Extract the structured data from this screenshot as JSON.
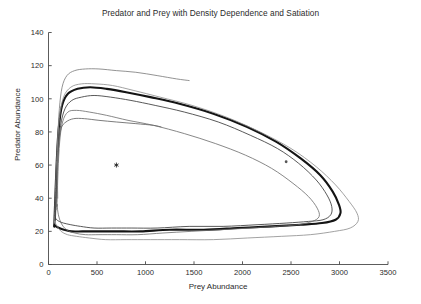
{
  "figure": {
    "background_color": "#ffffff",
    "axis_color": "#4a4a4a",
    "text_color": "#2b2b2b"
  },
  "chart_data": {
    "type": "line",
    "title": "Predator and Prey with Density Dependence and Satiation",
    "xlabel": "Prey Abundance",
    "ylabel": "Predator Abundance",
    "xlim": [
      0,
      3500
    ],
    "ylim": [
      0,
      140
    ],
    "xticks": [
      0,
      500,
      1000,
      1500,
      2000,
      2500,
      3000,
      3500
    ],
    "xticklabels": [
      "0",
      "500",
      "1000",
      "1500",
      "2000",
      "2500",
      "3000",
      "3500"
    ],
    "yticks": [
      0,
      20,
      40,
      60,
      80,
      100,
      120,
      140
    ],
    "yticklabels": [
      "0",
      "20",
      "40",
      "60",
      "80",
      "100",
      "120",
      "140"
    ],
    "grid": false,
    "legend": null,
    "axis_style": "left-and-bottom-spines-only",
    "markers": [
      {
        "name": "equilibrium-point",
        "symbol": "asterisk",
        "x": 700,
        "y": 60,
        "color": "#1a1a1a",
        "size": 5
      },
      {
        "name": "initial-condition-dot",
        "symbol": "dot",
        "x": 2450,
        "y": 62,
        "color": "#555555",
        "size": 1.4
      }
    ],
    "series": [
      {
        "name": "limit-cycle",
        "role": "stable limit cycle (attractor)",
        "color": "#141414",
        "linewidth": 2.1,
        "closed": true,
        "points": [
          [
            60,
            24
          ],
          [
            70,
            40
          ],
          [
            85,
            62
          ],
          [
            105,
            82
          ],
          [
            140,
            96
          ],
          [
            200,
            103
          ],
          [
            300,
            106
          ],
          [
            430,
            107
          ],
          [
            600,
            106
          ],
          [
            800,
            104
          ],
          [
            1050,
            101
          ],
          [
            1350,
            97
          ],
          [
            1700,
            91
          ],
          [
            2050,
            83
          ],
          [
            2350,
            74
          ],
          [
            2600,
            64
          ],
          [
            2800,
            54
          ],
          [
            2930,
            44
          ],
          [
            2995,
            36
          ],
          [
            3010,
            31
          ],
          [
            2960,
            27
          ],
          [
            2820,
            25
          ],
          [
            2600,
            24
          ],
          [
            2300,
            23
          ],
          [
            1950,
            22
          ],
          [
            1600,
            21
          ],
          [
            1250,
            21
          ],
          [
            950,
            20
          ],
          [
            700,
            20
          ],
          [
            500,
            20
          ],
          [
            350,
            20
          ],
          [
            240,
            20
          ],
          [
            160,
            21
          ],
          [
            110,
            22
          ],
          [
            78,
            23
          ],
          [
            60,
            24
          ]
        ]
      },
      {
        "name": "trajectory-inner-1",
        "role": "trajectory converging from inside",
        "color": "#3b3b3b",
        "linewidth": 0.85,
        "closed": true,
        "points": [
          [
            72,
            28
          ],
          [
            84,
            48
          ],
          [
            100,
            68
          ],
          [
            125,
            84
          ],
          [
            170,
            94
          ],
          [
            240,
            99
          ],
          [
            340,
            101
          ],
          [
            470,
            102
          ],
          [
            640,
            101
          ],
          [
            850,
            99
          ],
          [
            1100,
            96
          ],
          [
            1400,
            92
          ],
          [
            1750,
            86
          ],
          [
            2080,
            78
          ],
          [
            2360,
            70
          ],
          [
            2580,
            61
          ],
          [
            2760,
            51
          ],
          [
            2870,
            42
          ],
          [
            2920,
            35
          ],
          [
            2910,
            30
          ],
          [
            2830,
            27
          ],
          [
            2680,
            26
          ],
          [
            2450,
            25
          ],
          [
            2150,
            24
          ],
          [
            1800,
            23
          ],
          [
            1450,
            23
          ],
          [
            1120,
            22
          ],
          [
            860,
            22
          ],
          [
            650,
            22
          ],
          [
            470,
            22
          ],
          [
            330,
            23
          ],
          [
            230,
            24
          ],
          [
            155,
            25
          ],
          [
            110,
            26
          ],
          [
            85,
            27
          ],
          [
            72,
            28
          ]
        ]
      },
      {
        "name": "trajectory-inner-2",
        "role": "inner trajectory (open arc)",
        "color": "#5a5a5a",
        "linewidth": 0.8,
        "closed": false,
        "points": [
          [
            78,
            33
          ],
          [
            88,
            53
          ],
          [
            104,
            71
          ],
          [
            130,
            82
          ],
          [
            180,
            86
          ],
          [
            260,
            88
          ],
          [
            370,
            88
          ],
          [
            520,
            87
          ],
          [
            700,
            86
          ],
          [
            900,
            85
          ],
          [
            1080,
            84
          ],
          [
            1160,
            83
          ]
        ]
      },
      {
        "name": "trajectory-middle",
        "role": "intermediate trajectory",
        "color": "#6a6a6a",
        "linewidth": 0.8,
        "closed": true,
        "points": [
          [
            88,
            36
          ],
          [
            98,
            56
          ],
          [
            115,
            74
          ],
          [
            145,
            86
          ],
          [
            200,
            92
          ],
          [
            290,
            93
          ],
          [
            420,
            92
          ],
          [
            600,
            90
          ],
          [
            820,
            87
          ],
          [
            1080,
            84
          ],
          [
            1400,
            79
          ],
          [
            1720,
            73
          ],
          [
            2030,
            66
          ],
          [
            2300,
            58
          ],
          [
            2520,
            49
          ],
          [
            2680,
            41
          ],
          [
            2770,
            34
          ],
          [
            2790,
            29
          ],
          [
            2720,
            26
          ],
          [
            2570,
            24
          ],
          [
            2350,
            23
          ],
          [
            2080,
            22
          ],
          [
            1780,
            21
          ],
          [
            1470,
            20
          ],
          [
            1180,
            19
          ],
          [
            920,
            18
          ],
          [
            700,
            18
          ],
          [
            520,
            18
          ],
          [
            380,
            18
          ],
          [
            270,
            19
          ],
          [
            185,
            21
          ],
          [
            130,
            25
          ],
          [
            102,
            30
          ],
          [
            88,
            36
          ]
        ]
      },
      {
        "name": "trajectory-outer",
        "role": "outer trajectory spiralling inward",
        "color": "#777777",
        "linewidth": 0.8,
        "closed": false,
        "points": [
          [
            95,
            40
          ],
          [
            92,
            58
          ],
          [
            98,
            78
          ],
          [
            112,
            94
          ],
          [
            140,
            107
          ],
          [
            190,
            114
          ],
          [
            270,
            117
          ],
          [
            380,
            118
          ],
          [
            520,
            118
          ],
          [
            700,
            117
          ],
          [
            900,
            116
          ],
          [
            1120,
            114
          ],
          [
            1320,
            112
          ],
          [
            1450,
            111
          ]
        ]
      },
      {
        "name": "trajectory-outermost",
        "role": "outermost trajectory (largest loop)",
        "color": "#8a8a8a",
        "linewidth": 0.8,
        "closed": true,
        "points": [
          [
            62,
            26
          ],
          [
            72,
            46
          ],
          [
            88,
            68
          ],
          [
            112,
            88
          ],
          [
            155,
            101
          ],
          [
            230,
            107
          ],
          [
            340,
            109
          ],
          [
            480,
            109
          ],
          [
            660,
            108
          ],
          [
            880,
            105
          ],
          [
            1150,
            101
          ],
          [
            1480,
            96
          ],
          [
            1830,
            89
          ],
          [
            2180,
            80
          ],
          [
            2500,
            70
          ],
          [
            2760,
            59
          ],
          [
            2960,
            48
          ],
          [
            3100,
            38
          ],
          [
            3180,
            31
          ],
          [
            3190,
            26
          ],
          [
            3110,
            22
          ],
          [
            2950,
            20
          ],
          [
            2700,
            18
          ],
          [
            2400,
            17
          ],
          [
            2050,
            16
          ],
          [
            1700,
            15
          ],
          [
            1350,
            15
          ],
          [
            1050,
            15
          ],
          [
            800,
            15
          ],
          [
            590,
            15
          ],
          [
            420,
            16
          ],
          [
            290,
            17
          ],
          [
            195,
            18
          ],
          [
            130,
            20
          ],
          [
            90,
            23
          ],
          [
            62,
            26
          ]
        ]
      }
    ]
  }
}
